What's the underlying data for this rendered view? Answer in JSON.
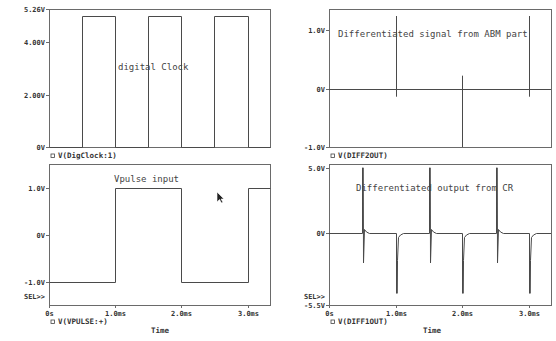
{
  "window": {
    "title": "PSpice Probe - Differentiator waveforms"
  },
  "colors": {
    "background": "#ffffff",
    "frame": "#6a6a6a",
    "trace": "#4a4a4a",
    "text": "#333333"
  },
  "cursor": {
    "x": 217,
    "y": 192,
    "icon": "mouse-pointer-icon"
  },
  "chart_data": [
    {
      "id": "digclock",
      "type": "line",
      "title": "digital Clock",
      "legend": "V(DigClock:1)",
      "legend_marker": "square-marker-icon",
      "xlabel": "",
      "ylabel": "",
      "xlim": [
        0,
        3.34
      ],
      "ylim": [
        0,
        5.26
      ],
      "x_unit": "ms",
      "y_ticks": [
        {
          "value": 5.26,
          "label": "5.26V"
        },
        {
          "value": 4.0,
          "label": "4.00V"
        },
        {
          "value": 2.0,
          "label": "2.00V"
        },
        {
          "value": 0,
          "label": "0V"
        }
      ],
      "x_ticks": [],
      "grid": false,
      "series": [
        {
          "name": "V(DigClock:1)",
          "x": [
            0,
            0.5,
            0.5,
            1.0,
            1.0,
            1.5,
            1.5,
            2.0,
            2.0,
            2.5,
            2.5,
            3.0,
            3.0,
            3.34
          ],
          "y": [
            0,
            0,
            5.0,
            5.0,
            0,
            0,
            5.0,
            5.0,
            0,
            0,
            5.0,
            5.0,
            0,
            0
          ]
        }
      ],
      "frame": {
        "left": 49,
        "top": 9,
        "right": 270,
        "bottom": 147
      },
      "annotation_pos": {
        "x": 118,
        "y": 70
      },
      "legend_pos": {
        "x": 51,
        "y": 158
      }
    },
    {
      "id": "vpulse",
      "type": "line",
      "title": "Vpulse input",
      "legend": "V(VPULSE:+)",
      "legend_marker": "square-marker-icon",
      "xlabel": "Time",
      "ylabel": "",
      "xlim": [
        0,
        3.34
      ],
      "ylim": [
        -1.5,
        1.5
      ],
      "x_unit": "ms",
      "sel_marker": "SEL>>",
      "y_ticks": [
        {
          "value": 1.0,
          "label": "1.0V"
        },
        {
          "value": 0,
          "label": "0V"
        },
        {
          "value": -1.0,
          "label": "-1.0V"
        }
      ],
      "x_ticks": [
        {
          "value": 0,
          "label": "0s"
        },
        {
          "value": 1.0,
          "label": "1.0ms"
        },
        {
          "value": 2.0,
          "label": "2.0ms"
        },
        {
          "value": 3.0,
          "label": "3.0ms"
        }
      ],
      "grid": false,
      "series": [
        {
          "name": "V(VPULSE:+)",
          "x": [
            0,
            1.0,
            1.0,
            2.0,
            2.0,
            3.0,
            3.0,
            3.34
          ],
          "y": [
            -1,
            -1,
            1,
            1,
            -1,
            -1,
            1,
            1
          ]
        }
      ],
      "frame": {
        "left": 49,
        "top": 164,
        "right": 270,
        "bottom": 305
      },
      "annotation_pos": {
        "x": 114,
        "y": 182
      },
      "legend_pos": {
        "x": 51,
        "y": 324
      },
      "xlabel_pos": {
        "x": 160,
        "y": 333
      }
    },
    {
      "id": "diff2out",
      "type": "line",
      "title": "Differentiated signal from ABM part",
      "legend": "V(DIFF2OUT)",
      "legend_marker": "square-marker-icon",
      "xlabel": "",
      "ylabel": "",
      "xlim": [
        0,
        3.33
      ],
      "ylim": [
        -1.0,
        1.36
      ],
      "x_unit": "ms",
      "y_ticks": [
        {
          "value": 1.0,
          "label": "1.0V"
        },
        {
          "value": 0,
          "label": "0V"
        },
        {
          "value": -1.0,
          "label": "-1.0V"
        }
      ],
      "x_ticks": [],
      "grid": false,
      "zero_line": true,
      "series": [
        {
          "name": "V(DIFF2OUT)",
          "spikes": [
            {
              "x": 1.0,
              "y_top": 1.24,
              "y_bottom": -0.14
            },
            {
              "x": 2.0,
              "y_top": 0.22,
              "y_bottom": -1.0
            },
            {
              "x": 3.0,
              "y_top": 1.24,
              "y_bottom": -0.14
            }
          ]
        }
      ],
      "frame": {
        "left": 329,
        "top": 9,
        "right": 551,
        "bottom": 147
      },
      "annotation_pos": {
        "x": 338,
        "y": 37
      },
      "legend_pos": {
        "x": 331,
        "y": 158
      }
    },
    {
      "id": "diff1out",
      "type": "line",
      "title": "Differentiated output from CR",
      "legend": "V(DIFF1OUT)",
      "legend_marker": "square-marker-icon",
      "xlabel": "Time",
      "ylabel": "",
      "xlim": [
        0,
        3.33
      ],
      "ylim": [
        -5.5,
        5.3
      ],
      "x_unit": "ms",
      "sel_marker": "SEL>>",
      "y_ticks": [
        {
          "value": 5.0,
          "label": "5.0V"
        },
        {
          "value": 0,
          "label": "0V"
        },
        {
          "value": -5.5,
          "label": "-5.5V"
        }
      ],
      "x_ticks": [
        {
          "value": 0,
          "label": "0s"
        },
        {
          "value": 1.0,
          "label": "1.0ms"
        },
        {
          "value": 2.0,
          "label": "2.0ms"
        },
        {
          "value": 3.0,
          "label": "3.0ms"
        }
      ],
      "grid": false,
      "series": [
        {
          "name": "V(DIFF1OUT)",
          "pulses": [
            {
              "x": 0.5,
              "peak": 5.0
            },
            {
              "x": 1.0,
              "peak": -4.6
            },
            {
              "x": 1.5,
              "peak": 5.0
            },
            {
              "x": 2.0,
              "peak": -4.6
            },
            {
              "x": 2.5,
              "peak": 5.0
            },
            {
              "x": 3.0,
              "peak": -4.6
            }
          ],
          "baseline": 0
        }
      ],
      "frame": {
        "left": 329,
        "top": 164,
        "right": 551,
        "bottom": 305
      },
      "annotation_pos": {
        "x": 356,
        "y": 191
      },
      "legend_pos": {
        "x": 331,
        "y": 324
      },
      "xlabel_pos": {
        "x": 432,
        "y": 333
      }
    }
  ]
}
